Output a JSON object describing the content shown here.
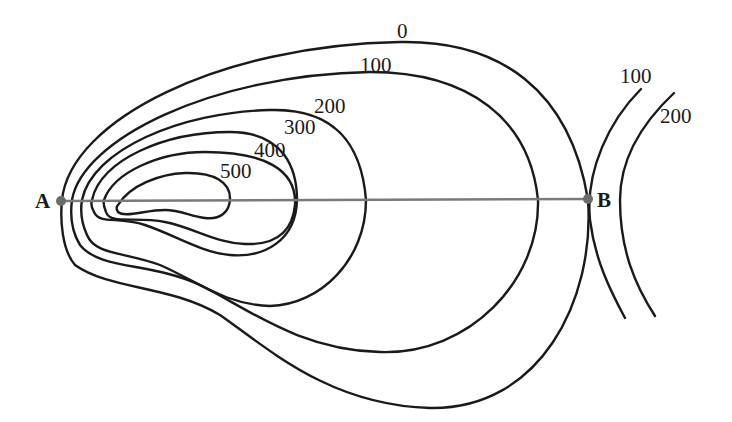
{
  "diagram": {
    "type": "topographic-contour-map",
    "points": {
      "a": {
        "label": "A"
      },
      "b": {
        "label": "B"
      }
    },
    "contour_labels": {
      "c0": "0",
      "c100": "100",
      "c200": "200",
      "c300": "300",
      "c400": "400",
      "c500": "500",
      "right_c100": "100",
      "right_c200": "200"
    },
    "colors": {
      "contour": "#1a1a1a",
      "profile_line": "#7a7a7a",
      "point": "#6b6b6b"
    }
  }
}
